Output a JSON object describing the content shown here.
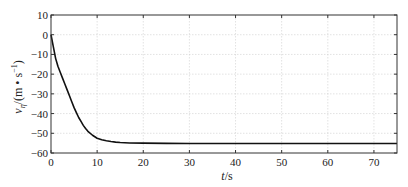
{
  "chart_data": {
    "type": "line",
    "title": "",
    "xlabel": "t/s",
    "xlabel_var": "t",
    "xlabel_unit": "/s",
    "ylabel": "vη/(m • s⁻¹)",
    "ylabel_var": "v",
    "ylabel_sub": "η",
    "ylabel_unit": "/(m • s",
    "ylabel_exp": "−1",
    "ylabel_close": ")",
    "xlim": [
      0,
      75
    ],
    "ylim": [
      -60,
      10
    ],
    "xticks": [
      0,
      10,
      20,
      30,
      40,
      50,
      60,
      70
    ],
    "yticks": [
      10,
      0,
      -10,
      -20,
      -30,
      -40,
      -50,
      -60
    ],
    "grid": true,
    "legend": null,
    "series": [
      {
        "name": "v",
        "color": "#111111",
        "x": [
          0,
          0.5,
          1,
          1.5,
          2,
          2.5,
          3,
          3.5,
          4,
          4.5,
          5,
          5.5,
          6,
          6.5,
          7,
          7.5,
          8,
          9,
          10,
          11,
          12,
          13,
          14,
          15,
          17,
          20,
          25,
          30,
          40,
          50,
          60,
          70,
          75
        ],
        "y": [
          0,
          -6,
          -12,
          -16,
          -19,
          -22,
          -25,
          -28,
          -31,
          -34,
          -37,
          -39.5,
          -42,
          -44,
          -46,
          -47.6,
          -49,
          -51,
          -52.5,
          -53.3,
          -53.8,
          -54.2,
          -54.5,
          -54.7,
          -54.9,
          -55.0,
          -55.1,
          -55.2,
          -55.2,
          -55.2,
          -55.2,
          -55.2,
          -55.2
        ]
      }
    ]
  },
  "colors": {
    "axis": "#333333",
    "grid": "#cfcfcf",
    "line": "#111111"
  }
}
